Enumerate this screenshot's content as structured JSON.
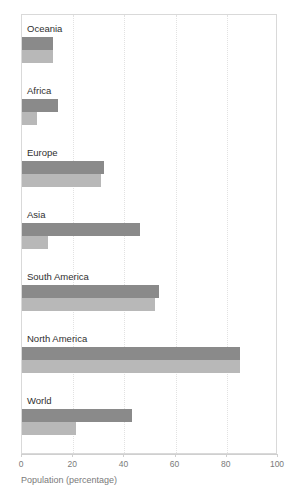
{
  "chart_data": {
    "type": "bar",
    "orientation": "horizontal",
    "title": "",
    "xlabel": "Population (percentage)",
    "ylabel": "",
    "xlim": [
      0,
      100
    ],
    "xticks": [
      0,
      20,
      40,
      60,
      80,
      100
    ],
    "xtick_labels": [
      "0",
      "20",
      "40",
      "60",
      "80",
      "100"
    ],
    "grid": true,
    "grid_axis": "x",
    "legend": "none",
    "categories": [
      "Oceania",
      "Africa",
      "Europe",
      "Asia",
      "South America",
      "North America",
      "World"
    ],
    "series": [
      {
        "name": "upper",
        "color": "#8a8a8a",
        "values": [
          12,
          14,
          32,
          46,
          53.5,
          85,
          43
        ]
      },
      {
        "name": "lower",
        "color": "#b8b8b8",
        "values": [
          12,
          6,
          31,
          10,
          52,
          85,
          21
        ]
      }
    ]
  },
  "axis": {
    "x_title": "Population (percentage)",
    "ticks": [
      {
        "value": 0,
        "label": "0"
      },
      {
        "value": 20,
        "label": "20"
      },
      {
        "value": 40,
        "label": "40"
      },
      {
        "value": 60,
        "label": "60"
      },
      {
        "value": 80,
        "label": "80"
      },
      {
        "value": 100,
        "label": "100"
      }
    ]
  },
  "groups": [
    {
      "label": "Oceania",
      "upper": 12,
      "lower": 12
    },
    {
      "label": "Africa",
      "upper": 14,
      "lower": 6
    },
    {
      "label": "Europe",
      "upper": 32,
      "lower": 31
    },
    {
      "label": "Asia",
      "upper": 46,
      "lower": 10
    },
    {
      "label": "South America",
      "upper": 53.5,
      "lower": 52
    },
    {
      "label": "North America",
      "upper": 85,
      "lower": 85
    },
    {
      "label": "World",
      "upper": 43,
      "lower": 21
    }
  ],
  "colors": {
    "bar_upper": "#8a8a8a",
    "bar_lower": "#b8b8b8",
    "frame": "#d9d9d9",
    "gridline": "#e2e2e2",
    "label_text": "#2f2f2f",
    "axis_text": "#7a7a7a"
  }
}
